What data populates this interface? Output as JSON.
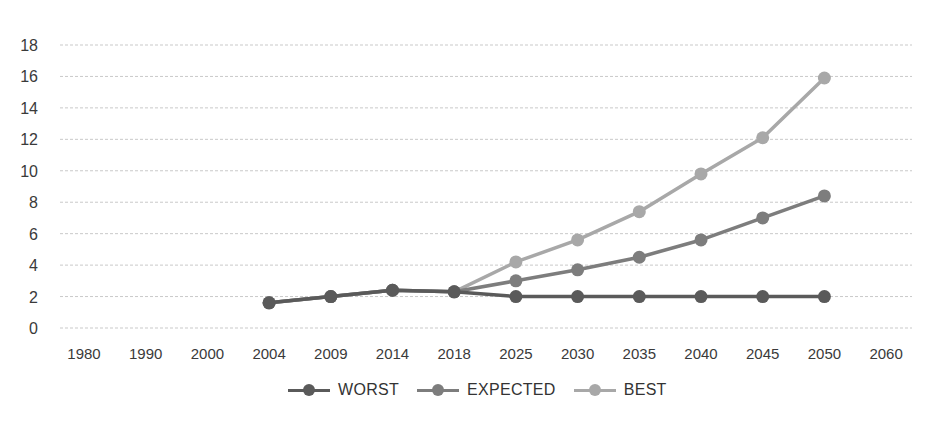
{
  "chart_data": {
    "type": "line",
    "title": "",
    "xlabel": "",
    "ylabel": "",
    "ylim": [
      0,
      18
    ],
    "yticks": [
      0,
      2,
      4,
      6,
      8,
      10,
      12,
      14,
      16,
      18
    ],
    "grid": true,
    "legend_position": "bottom",
    "categories": [
      "1980",
      "1990",
      "2000",
      "2004",
      "2009",
      "2014",
      "2018",
      "2025",
      "2030",
      "2035",
      "2040",
      "2045",
      "2050",
      "2060"
    ],
    "series": [
      {
        "name": "WORST",
        "color": "#5a5a5a",
        "values": [
          null,
          null,
          null,
          1.6,
          2.0,
          2.4,
          2.3,
          2.0,
          2.0,
          2.0,
          2.0,
          2.0,
          2.0,
          null
        ]
      },
      {
        "name": "EXPECTED",
        "color": "#7d7d7d",
        "values": [
          null,
          null,
          null,
          1.6,
          2.0,
          2.4,
          2.3,
          3.0,
          3.7,
          4.5,
          5.6,
          7.0,
          8.4,
          null
        ]
      },
      {
        "name": "BEST",
        "color": "#a8a8a8",
        "values": [
          null,
          null,
          null,
          1.6,
          2.0,
          2.4,
          2.3,
          4.2,
          5.6,
          7.4,
          9.8,
          12.1,
          15.9,
          null
        ]
      }
    ]
  },
  "legend": {
    "items": [
      {
        "label": "WORST",
        "color": "#5a5a5a"
      },
      {
        "label": "EXPECTED",
        "color": "#7d7d7d"
      },
      {
        "label": "BEST",
        "color": "#a8a8a8"
      }
    ]
  }
}
